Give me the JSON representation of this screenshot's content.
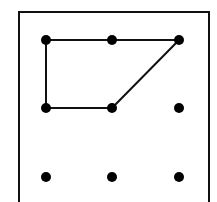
{
  "diagram": {
    "colors": {
      "stroke": "#111111",
      "dot": "#000000",
      "background": "#ffffff"
    },
    "frame": {
      "x": 19,
      "y": 12,
      "width": 190,
      "height": 200
    },
    "grid": {
      "rows": 3,
      "cols": 3,
      "xs": [
        46,
        112,
        179
      ],
      "ys": [
        40,
        108,
        177
      ],
      "dot_radius": 5
    },
    "path": [
      {
        "row": 1,
        "col": 0
      },
      {
        "row": 0,
        "col": 0
      },
      {
        "row": 0,
        "col": 1
      },
      {
        "row": 0,
        "col": 2
      },
      {
        "row": 1,
        "col": 1
      },
      {
        "row": 1,
        "col": 0
      }
    ]
  }
}
